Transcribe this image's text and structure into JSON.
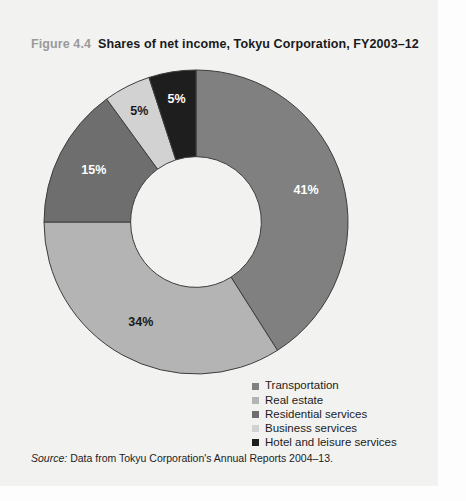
{
  "figure": {
    "number": "Figure 4.4",
    "caption": "Shares of net income, Tokyu Corporation, FY2003–12"
  },
  "source": {
    "label": "Source:",
    "text": "Data from Tokyu Corporation's Annual Reports 2004–13."
  },
  "legend": {
    "items": [
      {
        "label": "Transportation",
        "color": "#808080"
      },
      {
        "label": "Real estate",
        "color": "#b4b4b4"
      },
      {
        "label": "Residential services",
        "color": "#6e6e6e"
      },
      {
        "label": "Business services",
        "color": "#d2d2d2"
      },
      {
        "label": "Hotel and leisure services",
        "color": "#1e1e1e"
      }
    ]
  },
  "chart_data": {
    "type": "pie",
    "variant": "donut",
    "title": "Shares of net income, Tokyu Corporation, FY2003–12",
    "categories": [
      "Transportation",
      "Real estate",
      "Residential services",
      "Business services",
      "Hotel and leisure services"
    ],
    "values": [
      41,
      34,
      15,
      5,
      5
    ],
    "value_labels": [
      "41%",
      "34%",
      "15%",
      "5%",
      "5%"
    ],
    "colors": [
      "#808080",
      "#b4b4b4",
      "#6e6e6e",
      "#d2d2d2",
      "#1e1e1e"
    ],
    "label_colors": [
      "#ffffff",
      "#1a1a1a",
      "#ffffff",
      "#1a1a1a",
      "#ffffff"
    ],
    "units": "percent",
    "total": 100,
    "start_angle_deg": 0,
    "direction": "clockwise",
    "inner_radius_ratio": 0.43,
    "legend_position": "bottom-right",
    "grid": false
  }
}
